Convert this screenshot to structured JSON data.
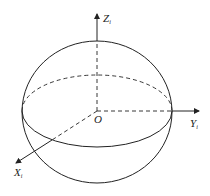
{
  "diagram": {
    "type": "coordinate-sphere",
    "origin_label": "O",
    "axes": [
      {
        "name": "Z",
        "subscript": "i"
      },
      {
        "name": "Y",
        "subscript": "i"
      },
      {
        "name": "X",
        "subscript": "i"
      }
    ],
    "stroke_color": "#222222"
  }
}
